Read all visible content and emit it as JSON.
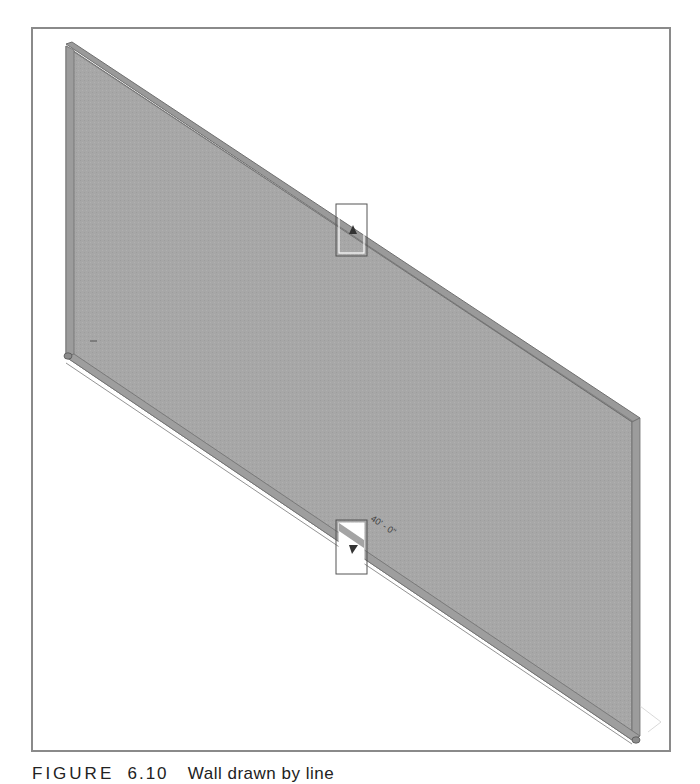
{
  "figure": {
    "label": "FIGURE",
    "number": "6.10",
    "caption_text": "Wall drawn by line"
  },
  "drawing": {
    "element": "wall",
    "view": "3D isometric",
    "dimension_label": "40' - 0\"",
    "wall_color": "#a6a6a6",
    "wall_edge_color": "#6f6f6f",
    "frame_color": "#8a8a8a",
    "grips": [
      {
        "name": "flip-arrow-top",
        "direction": "up"
      },
      {
        "name": "flip-arrow-bottom",
        "direction": "down"
      }
    ]
  }
}
